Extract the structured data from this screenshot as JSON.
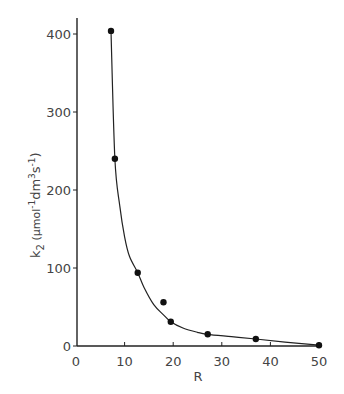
{
  "chart_data": {
    "type": "line",
    "title": "",
    "xlabel": "R",
    "ylabel": "k2 (μmol-1dm3s-1)",
    "ylabel_parts": {
      "main": "k",
      "sub": "2",
      "unit_open": " (μmol",
      "exp1": "-1",
      "dm": "dm",
      "exp2": "3",
      "s": "s",
      "exp3": "-1",
      "close": ")"
    },
    "xlim": [
      0,
      50
    ],
    "ylim": [
      0,
      420
    ],
    "xticks": [
      0,
      10,
      20,
      30,
      40,
      50
    ],
    "yticks": [
      0,
      100,
      200,
      300,
      400
    ],
    "grid": false,
    "legend": null,
    "series": [
      {
        "name": "measured k2",
        "style": "points",
        "x": [
          7.2,
          8.0,
          12.7,
          18.0,
          19.5,
          27.1,
          37.0,
          50.0
        ],
        "y": [
          404,
          240,
          94,
          56,
          31,
          15,
          9,
          1
        ]
      },
      {
        "name": "fitted curve",
        "style": "line",
        "x": [
          7.2,
          8.0,
          9.0,
          10.0,
          11.0,
          12.7,
          14.0,
          16.0,
          18.0,
          19.5,
          22.0,
          25.0,
          27.1,
          32.0,
          37.0,
          43.0,
          50.0
        ],
        "y": [
          404,
          240,
          180,
          140,
          115,
          94,
          75,
          53,
          40,
          31,
          23,
          17.5,
          15,
          12,
          9,
          5,
          1
        ]
      }
    ]
  }
}
